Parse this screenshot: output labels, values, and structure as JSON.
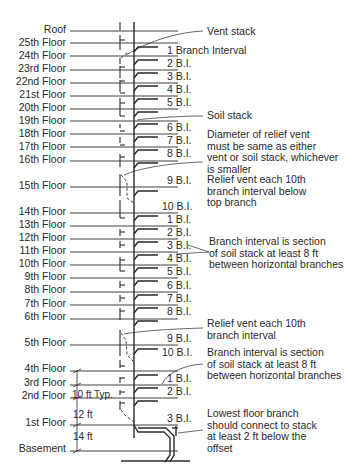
{
  "floors": [
    {
      "label": "Roof",
      "y": 31
    },
    {
      "label": "25th Floor",
      "y": 43
    },
    {
      "label": "24th Floor",
      "y": 56
    },
    {
      "label": "23rd Floor",
      "y": 70
    },
    {
      "label": "22nd Floor",
      "y": 83
    },
    {
      "label": "21st Floor",
      "y": 96
    },
    {
      "label": "20th Floor",
      "y": 109
    },
    {
      "label": "19th Floor",
      "y": 121
    },
    {
      "label": "18th Floor",
      "y": 134
    },
    {
      "label": "17th Floor",
      "y": 147
    },
    {
      "label": "16th Floor",
      "y": 161
    },
    {
      "label": "15th Floor",
      "y": 187
    },
    {
      "label": "14th Floor",
      "y": 213
    },
    {
      "label": "13th Floor",
      "y": 226
    },
    {
      "label": "12th Floor",
      "y": 239
    },
    {
      "label": "11th Floor",
      "y": 252
    },
    {
      "label": "10th Floor",
      "y": 265
    },
    {
      "label": "9th Floor",
      "y": 278
    },
    {
      "label": "8th Floor",
      "y": 292
    },
    {
      "label": "7th Floor",
      "y": 305
    },
    {
      "label": "6th Floor",
      "y": 319
    },
    {
      "label": "5th Floor",
      "y": 345
    },
    {
      "label": "4th Floor",
      "y": 371
    },
    {
      "label": "3rd Floor",
      "y": 385
    },
    {
      "label": "2nd Floor",
      "y": 398
    },
    {
      "label": "1st Floor",
      "y": 425
    },
    {
      "label": "Basement",
      "y": 451
    }
  ],
  "branch_intervals": [
    {
      "label": "1 Branch Interval",
      "y": 49
    },
    {
      "label": "2 B.I.",
      "y": 62
    },
    {
      "label": "3 B.I.",
      "y": 75
    },
    {
      "label": "4 B.I.",
      "y": 88
    },
    {
      "label": "5 B.I.",
      "y": 101
    },
    {
      "label": "6 B.I.",
      "y": 126
    },
    {
      "label": "7 B.I.",
      "y": 139
    },
    {
      "label": "8 B.I.",
      "y": 152
    },
    {
      "label": "9 B.I.",
      "y": 179
    },
    {
      "label": "10 B.I.",
      "y": 205
    },
    {
      "label": "1 B.I.",
      "y": 218
    },
    {
      "label": "2 B.I.",
      "y": 231
    },
    {
      "label": "3 B.I.",
      "y": 244
    },
    {
      "label": "4 B.I.",
      "y": 257
    },
    {
      "label": "5 B.I.",
      "y": 270
    },
    {
      "label": "6 B.I.",
      "y": 284
    },
    {
      "label": "7 B.I.",
      "y": 297
    },
    {
      "label": "8 B.I.",
      "y": 310
    },
    {
      "label": "9 B.I.",
      "y": 337
    },
    {
      "label": "10 B.I.",
      "y": 351
    },
    {
      "label": "1 B.I.",
      "y": 377
    },
    {
      "label": "2 B.I.",
      "y": 390
    },
    {
      "label": "3 B.I.",
      "y": 417
    }
  ],
  "callouts": {
    "vent_stack": "Vent stack",
    "soil_stack": "Soil stack",
    "relief_vent_diameter": "Diameter of relief vent\nmust be same as either\nvent or soil stack, whichever\nis smaller",
    "relief_vent_below_top": "Relief vent each 10th\nbranch interval below\ntop branch",
    "branch_interval_def_1": "Branch interval is section\nof soil stack at least 8 ft\nbetween horizontal branches",
    "relief_vent_each": "Relief vent each 10th\nbranch interval",
    "branch_interval_def_2": "Branch interval is section\nof soil stack at least 8 ft\nbetween horizontal branches",
    "lowest_floor": "Lowest floor branch\nshould connect to stack\nat least 2 ft below the\noffset"
  },
  "dimensions": {
    "typical": "10 ft Typ.",
    "first_floor": "12 ft",
    "basement": "14 ft"
  },
  "colors": {
    "line": "#2a2a2a",
    "background": "#ffffff"
  }
}
